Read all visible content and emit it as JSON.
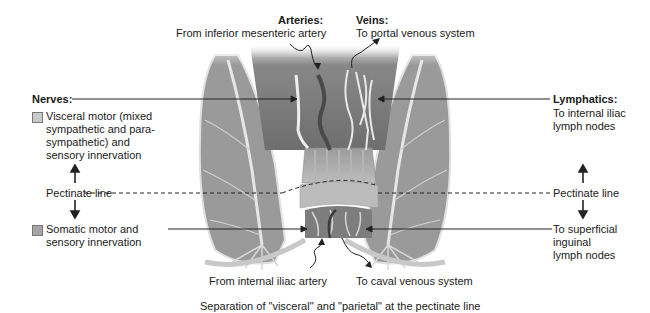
{
  "figure": {
    "caption": "Separation of \"visceral\" and \"parietal\" at the pectinate line"
  },
  "arteries": {
    "heading": "Arteries:",
    "upper": "From inferior mesenteric artery",
    "lower": "From internal iliac artery"
  },
  "veins": {
    "heading": "Veins:",
    "upper": "To portal venous system",
    "lower": "To caval venous system"
  },
  "nerves": {
    "heading": "Nerves:",
    "upper": "Visceral motor (mixed\nsympathetic and para-\nsympathetic) and\nsensory innervation",
    "lower": "Somatic motor and\nsensory innervation",
    "upper_swatch_color": "#c9c9c9",
    "lower_swatch_color": "#a5a5a5"
  },
  "lymphatics": {
    "heading": "Lymphatics:",
    "upper": "To internal iliac\nlymph nodes",
    "lower": "To superficial\ninguinal\nlymph nodes"
  },
  "pectinate": {
    "left_label": "Pectinate line",
    "right_label": "Pectinate line"
  },
  "colors": {
    "tissue_dark": "#7f7f7f",
    "tissue_mid": "#a3a3a3",
    "tissue_light": "#d4d4d4",
    "vessel": "#e8e8e8",
    "line": "#222222"
  }
}
